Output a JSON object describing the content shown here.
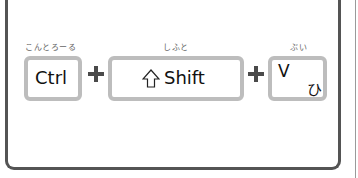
{
  "shortcut": {
    "keys": [
      {
        "id": "ctrl",
        "label": "Ctrl",
        "furigana": "こんとろーる"
      },
      {
        "id": "shift",
        "label": "Shift",
        "furigana": "しふと",
        "icon": "shift-arrow-icon",
        "icon_glyph": "⇧"
      },
      {
        "id": "v",
        "label": "V",
        "kana": "ひ",
        "furigana": "ぶい"
      }
    ],
    "separator": "+"
  },
  "colors": {
    "frame": "#545454",
    "key_border": "#bdbdbd",
    "plus": "#4a4a4a",
    "text": "#111111",
    "furigana": "#666666"
  }
}
